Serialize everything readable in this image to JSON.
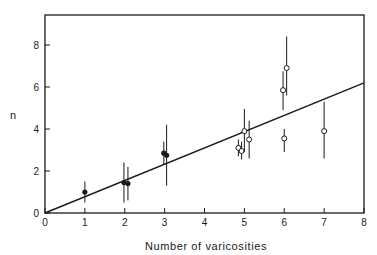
{
  "chart_data": {
    "type": "scatter",
    "title": "",
    "xlabel": "Number of varicosities",
    "ylabel": "n",
    "xlim": [
      0,
      8
    ],
    "ylim": [
      0,
      9.4
    ],
    "xticks": [
      "0",
      "1",
      "2",
      "3",
      "4",
      "5",
      "6",
      "7",
      "8"
    ],
    "yticks": [
      "0",
      "2",
      "4",
      "6",
      "8"
    ],
    "grid": false,
    "legend": null,
    "series": [
      {
        "name": "filled",
        "marker": "filled-circle",
        "points": [
          {
            "x": 1.0,
            "y": 1.0,
            "lo": 0.5,
            "hi": 1.5
          },
          {
            "x": 1.98,
            "y": 1.45,
            "lo": 0.5,
            "hi": 2.4
          },
          {
            "x": 2.08,
            "y": 1.4,
            "lo": 0.6,
            "hi": 2.2
          },
          {
            "x": 2.98,
            "y": 2.85,
            "lo": 2.3,
            "hi": 3.4
          },
          {
            "x": 3.05,
            "y": 2.75,
            "lo": 1.3,
            "hi": 4.2
          }
        ]
      },
      {
        "name": "open",
        "marker": "open-circle",
        "points": [
          {
            "x": 4.85,
            "y": 3.1,
            "lo": 2.7,
            "hi": 3.5
          },
          {
            "x": 4.93,
            "y": 2.95,
            "lo": 2.55,
            "hi": 3.4
          },
          {
            "x": 5.0,
            "y": 3.9,
            "lo": 2.9,
            "hi": 4.95
          },
          {
            "x": 5.12,
            "y": 3.5,
            "lo": 2.6,
            "hi": 4.4
          },
          {
            "x": 5.97,
            "y": 5.85,
            "lo": 4.9,
            "hi": 6.75
          },
          {
            "x": 6.06,
            "y": 6.9,
            "lo": 5.6,
            "hi": 8.4
          },
          {
            "x": 6.0,
            "y": 3.55,
            "lo": 2.9,
            "hi": 4.0
          },
          {
            "x": 7.0,
            "y": 3.9,
            "lo": 2.6,
            "hi": 5.3
          }
        ]
      }
    ],
    "fit_line": {
      "x0": 0,
      "y0": 0,
      "x1": 8,
      "y1": 6.2
    }
  }
}
